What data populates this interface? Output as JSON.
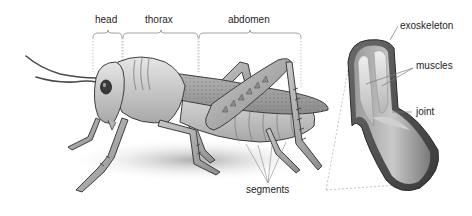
{
  "diagram": {
    "body_regions": [
      {
        "id": "head",
        "label": "head"
      },
      {
        "id": "thorax",
        "label": "thorax"
      },
      {
        "id": "abdomen",
        "label": "abdomen"
      }
    ],
    "callouts": {
      "segments": "segments",
      "exoskeleton": "exoskeleton",
      "muscles": "muscles",
      "joint": "joint"
    },
    "inset": {
      "description": "cross-section of leg joint"
    },
    "colors": {
      "line": "#777777",
      "dashed": "#9a9a9a",
      "body_light": "#d4d4d4",
      "body_mid": "#9c9c9c",
      "body_dark": "#4a4a4a",
      "text": "#1e1e1e"
    }
  }
}
